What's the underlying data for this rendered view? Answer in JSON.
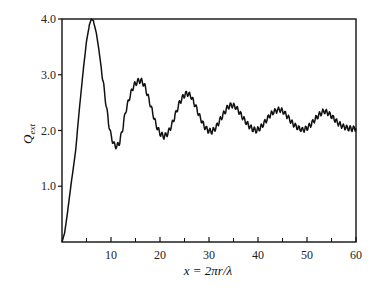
{
  "chart_data": {
    "type": "line",
    "title": "",
    "xlabel": "x = 2πr/λ",
    "ylabel": "Q_ext",
    "ylabel_main": "Q",
    "ylabel_sub": "ext",
    "xlim": [
      0,
      60
    ],
    "ylim": [
      0,
      4.0
    ],
    "grid": false,
    "legend": null,
    "x_ticks_major": [
      10,
      20,
      30,
      40,
      50,
      60
    ],
    "x_ticks_minor": [
      5,
      15,
      25,
      35,
      45,
      55
    ],
    "x_tick_labels": [
      "10",
      "20",
      "30",
      "40",
      "50",
      "60"
    ],
    "y_ticks": [
      1.0,
      2.0,
      3.0,
      4.0
    ],
    "y_tick_labels": [
      "1.0",
      "2.0",
      "3.0",
      "4.0"
    ],
    "series": [
      {
        "name": "Q_ext",
        "color": "#111111",
        "x": [
          0,
          0.5,
          1.0,
          1.8,
          2.8,
          3.5,
          4.3,
          5.0,
          5.6,
          6.0,
          6.4,
          7.0,
          7.6,
          8.2,
          8.8,
          9.4,
          10.0,
          10.6,
          11.2,
          11.8,
          12.4,
          13.0,
          13.8,
          14.6,
          15.4,
          16.1,
          16.8,
          17.6,
          18.4,
          19.2,
          20.0,
          20.8,
          21.6,
          22.4,
          23.2,
          24.0,
          24.8,
          25.5,
          26.3,
          27.2,
          28.1,
          29.0,
          29.8,
          30.6,
          31.4,
          32.2,
          33.0,
          33.8,
          34.6,
          35.5,
          36.4,
          37.3,
          38.2,
          39.0,
          39.7,
          40.5,
          41.4,
          42.3,
          43.2,
          44.4,
          45.3,
          46.2,
          47.1,
          48.1,
          49.1,
          50.0,
          50.9,
          51.8,
          52.7,
          53.5,
          54.4,
          55.4,
          56.4,
          57.4,
          58.4,
          59.2,
          60.0
        ],
        "values": [
          0.0,
          0.15,
          0.45,
          1.0,
          1.65,
          2.35,
          3.05,
          3.6,
          3.9,
          4.0,
          3.97,
          3.75,
          3.4,
          3.0,
          2.6,
          2.2,
          1.9,
          1.75,
          1.71,
          1.8,
          2.05,
          2.35,
          2.6,
          2.8,
          2.88,
          2.9,
          2.82,
          2.6,
          2.35,
          2.1,
          1.95,
          1.89,
          1.95,
          2.1,
          2.3,
          2.5,
          2.62,
          2.67,
          2.62,
          2.45,
          2.25,
          2.08,
          2.0,
          1.98,
          2.05,
          2.18,
          2.3,
          2.42,
          2.46,
          2.42,
          2.3,
          2.18,
          2.08,
          2.02,
          2.0,
          2.05,
          2.15,
          2.26,
          2.34,
          2.38,
          2.33,
          2.23,
          2.12,
          2.05,
          2.01,
          2.04,
          2.12,
          2.22,
          2.3,
          2.35,
          2.31,
          2.22,
          2.13,
          2.07,
          2.04,
          2.03,
          2.04
        ]
      }
    ]
  }
}
